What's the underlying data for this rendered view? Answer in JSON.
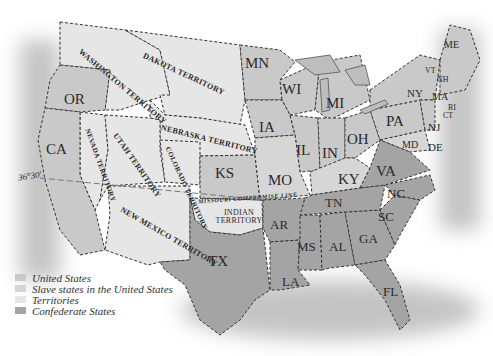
{
  "map": {
    "colors": {
      "background": "#ffffff",
      "union": "#c9c9c9",
      "slave_union": "#d6d6d6",
      "territory": "#e6e6e6",
      "confederate": "#a4a4a4",
      "water_shade": "#b8b8b8",
      "border": "#333333"
    },
    "states": {
      "OR": "OR",
      "CA": "CA",
      "KS": "KS",
      "TX": "TX",
      "MN": "MN",
      "WI": "WI",
      "MI": "MI",
      "IA": "IA",
      "IL": "IL",
      "IN": "IN",
      "OH": "OH",
      "MO": "MO",
      "KY": "KY",
      "PA": "PA",
      "NY": "NY",
      "VA": "VA",
      "NC": "NC",
      "SC": "SC",
      "TN": "TN",
      "GA": "GA",
      "AL": "AL",
      "MS": "MS",
      "AR": "AR",
      "LA": "LA",
      "FL": "FL",
      "ME": "ME",
      "VT": "VT",
      "NH": "NH",
      "MA": "MA",
      "RI": "RI",
      "CT": "CT",
      "NJ": "NJ",
      "MD": "MD",
      "DE": "DE"
    },
    "territories": {
      "washington": "WASHINGTON TERRITORY",
      "dakota": "DAKOTA TERRITORY",
      "nebraska": "NEBRASKA TERRITORY",
      "nevada": "NEVADA TERRITORY",
      "utah": "UTAH TERRITORY",
      "colorado": "COLORADO TERRITORY",
      "new_mexico": "NEW MEXICO TERRITORY",
      "indian": "INDIAN TERRITORY"
    },
    "annotations": {
      "parallel": "36°30'",
      "compromise_line": "MISSOURI COMPROMISE LINE"
    }
  },
  "legend": {
    "items": [
      {
        "label": "United States",
        "color": "#c9c9c9"
      },
      {
        "label": "Slave states in the United States",
        "color": "#d6d6d6"
      },
      {
        "label": "Territories",
        "color": "#e6e6e6"
      },
      {
        "label": "Confederate States",
        "color": "#a4a4a4"
      }
    ]
  }
}
